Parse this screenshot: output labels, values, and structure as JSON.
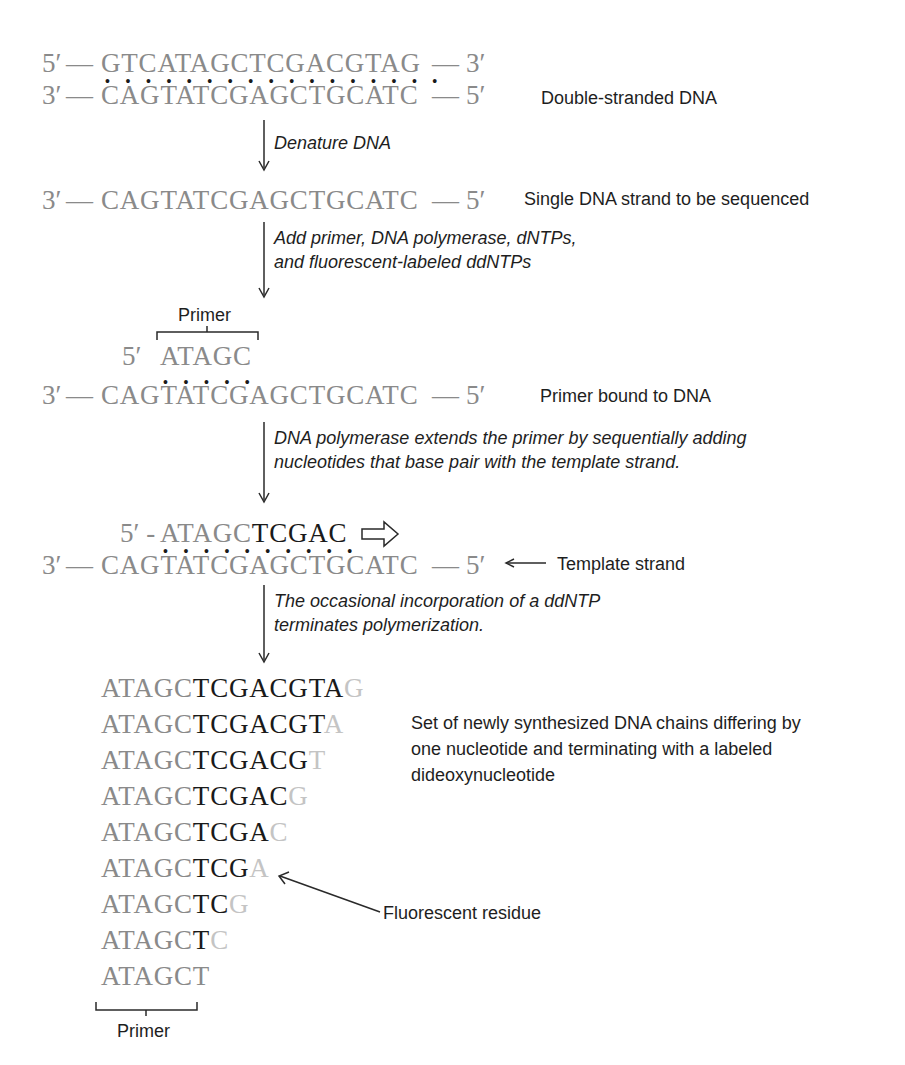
{
  "diagram": {
    "stage1": {
      "top_strand": {
        "five_prime": "5′",
        "sequence": "GTCATAGCTCGACGTAG",
        "three_prime": "3′"
      },
      "bottom_strand": {
        "three_prime": "3′",
        "sequence": "CAGTATCGAGCTGCATC",
        "five_prime": "5′"
      },
      "label": "Double-stranded DNA"
    },
    "step1": {
      "text": "Denature DNA"
    },
    "stage2": {
      "strand": {
        "three_prime": "3′",
        "sequence": "CAGTATCGAGCTGCATC",
        "five_prime": "5′"
      },
      "label": "Single DNA strand to be sequenced"
    },
    "step2": {
      "line1": "Add primer, DNA polymerase, dNTPs,",
      "line2": "and fluorescent-labeled ddNTPs"
    },
    "stage3": {
      "primer_label": "Primer",
      "primer": {
        "five_prime": "5′",
        "sequence": "ATAGC"
      },
      "strand": {
        "three_prime": "3′",
        "sequence": "CAGTATCGAGCTGCATC",
        "five_prime": "5′"
      },
      "label": "Primer bound to DNA"
    },
    "step3": {
      "line1": "DNA polymerase extends the primer by sequentially adding",
      "line2": "nucleotides that base pair with the template strand."
    },
    "stage4": {
      "growing": {
        "five_prime": "5′ -",
        "primer": "ATAGC",
        "extension": "TCGAC"
      },
      "strand": {
        "three_prime": "3′",
        "sequence": "CAGTATCGAGCTGCATC",
        "five_prime": "5′"
      },
      "label": "Template strand"
    },
    "step4": {
      "line1": "The occasional incorporation of a ddNTP",
      "line2": "terminates polymerization."
    },
    "stage5": {
      "chains": [
        {
          "primer": "ATAGC",
          "extension": "TCGACGTA",
          "terminal": "G"
        },
        {
          "primer": "ATAGC",
          "extension": "TCGACGT",
          "terminal": "A"
        },
        {
          "primer": "ATAGC",
          "extension": "TCGACG",
          "terminal": "T"
        },
        {
          "primer": "ATAGC",
          "extension": "TCGAC",
          "terminal": "G"
        },
        {
          "primer": "ATAGC",
          "extension": "TCGA",
          "terminal": "C"
        },
        {
          "primer": "ATAGC",
          "extension": "TCG",
          "terminal": "A"
        },
        {
          "primer": "ATAGC",
          "extension": "TC",
          "terminal": "G"
        },
        {
          "primer": "ATAGC",
          "extension": "T",
          "terminal": "C"
        },
        {
          "primer": "ATAGC",
          "extension": "",
          "terminal": "T"
        }
      ],
      "set_label": {
        "line1": "Set of newly synthesized DNA chains differing by",
        "line2": "one nucleotide and terminating with a labeled",
        "line3": "dideoxynucleotide"
      },
      "fluorescent_label": "Fluorescent residue",
      "primer_label": "Primer"
    },
    "colors": {
      "template_text": "#8a8a8a",
      "new_nucleotides": "#1a1a1a",
      "labeled_residue": "#c4c4c4",
      "label_text": "#1e1e1e"
    }
  }
}
